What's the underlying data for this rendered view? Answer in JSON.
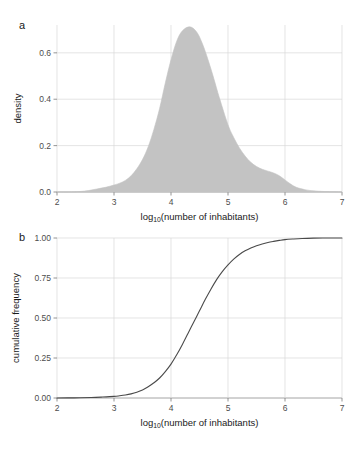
{
  "figure": {
    "background_color": "#ffffff",
    "panels": [
      {
        "label": "a",
        "xlabel_main": "log",
        "xlabel_sub": "10",
        "xlabel_rest": "(number of inhabitants)",
        "ylabel": "density"
      },
      {
        "label": "b",
        "xlabel_main": "log",
        "xlabel_sub": "10",
        "xlabel_rest": "(number of inhabitants)",
        "ylabel": "cumulative frequency"
      }
    ]
  },
  "chart_data": [
    {
      "type": "area",
      "panel": "a",
      "title": "",
      "xlabel": "log10(number of inhabitants)",
      "ylabel": "density",
      "xlim": [
        2,
        7
      ],
      "ylim": [
        0.0,
        0.72
      ],
      "grid": true,
      "fill_color": "#c3c3c3",
      "line_color": "#c3c3c3",
      "xticks": [
        2,
        3,
        4,
        5,
        6,
        7
      ],
      "xtick_labels": [
        "2",
        "3",
        "4",
        "5",
        "6",
        "7"
      ],
      "yticks": [
        0.0,
        0.2,
        0.4,
        0.6
      ],
      "ytick_labels": [
        "0.0",
        "0.2",
        "0.4",
        "0.6"
      ],
      "x": [
        2.0,
        2.2,
        2.4,
        2.55,
        2.7,
        2.85,
        3.0,
        3.1,
        3.2,
        3.3,
        3.4,
        3.5,
        3.6,
        3.7,
        3.8,
        3.9,
        4.0,
        4.1,
        4.2,
        4.33,
        4.45,
        4.55,
        4.65,
        4.75,
        4.85,
        5.0,
        5.1,
        5.2,
        5.3,
        5.4,
        5.5,
        5.6,
        5.7,
        5.8,
        5.9,
        6.0,
        6.1,
        6.2,
        6.35,
        6.5,
        6.7,
        7.0
      ],
      "y": [
        0.0,
        0.0,
        0.002,
        0.006,
        0.013,
        0.02,
        0.03,
        0.038,
        0.05,
        0.07,
        0.1,
        0.14,
        0.195,
        0.27,
        0.36,
        0.47,
        0.57,
        0.65,
        0.695,
        0.712,
        0.69,
        0.64,
        0.57,
        0.49,
        0.405,
        0.29,
        0.235,
        0.19,
        0.155,
        0.128,
        0.11,
        0.098,
        0.09,
        0.082,
        0.07,
        0.052,
        0.034,
        0.02,
        0.01,
        0.005,
        0.002,
        0.0
      ],
      "peak": {
        "x": 4.33,
        "y": 0.712
      }
    },
    {
      "type": "line",
      "panel": "b",
      "title": "",
      "xlabel": "log10(number of inhabitants)",
      "ylabel": "cumulative frequency",
      "xlim": [
        2,
        7
      ],
      "ylim": [
        0.0,
        1.0
      ],
      "grid": true,
      "line_color": "#4a4a4a",
      "xticks": [
        2,
        3,
        4,
        5,
        6,
        7
      ],
      "xtick_labels": [
        "2",
        "3",
        "4",
        "5",
        "6",
        "7"
      ],
      "yticks": [
        0.0,
        0.25,
        0.5,
        0.75,
        1.0
      ],
      "ytick_labels": [
        "0.00",
        "0.25",
        "0.50",
        "0.75",
        "1.00"
      ],
      "x": [
        2.0,
        2.3,
        2.6,
        2.8,
        3.0,
        3.1,
        3.2,
        3.3,
        3.4,
        3.5,
        3.6,
        3.7,
        3.8,
        3.9,
        4.0,
        4.1,
        4.2,
        4.3,
        4.4,
        4.5,
        4.6,
        4.7,
        4.8,
        4.9,
        5.0,
        5.1,
        5.2,
        5.3,
        5.4,
        5.5,
        5.6,
        5.7,
        5.8,
        5.9,
        6.0,
        6.15,
        6.3,
        6.5,
        6.75,
        7.0
      ],
      "y": [
        0.0,
        0.001,
        0.003,
        0.006,
        0.01,
        0.014,
        0.019,
        0.026,
        0.036,
        0.05,
        0.07,
        0.095,
        0.125,
        0.165,
        0.212,
        0.27,
        0.335,
        0.405,
        0.475,
        0.545,
        0.615,
        0.68,
        0.74,
        0.79,
        0.832,
        0.868,
        0.897,
        0.92,
        0.938,
        0.952,
        0.963,
        0.972,
        0.979,
        0.985,
        0.99,
        0.994,
        0.997,
        0.999,
        1.0,
        1.0
      ],
      "midpoint": {
        "x": 4.49,
        "y": 0.5
      }
    }
  ]
}
